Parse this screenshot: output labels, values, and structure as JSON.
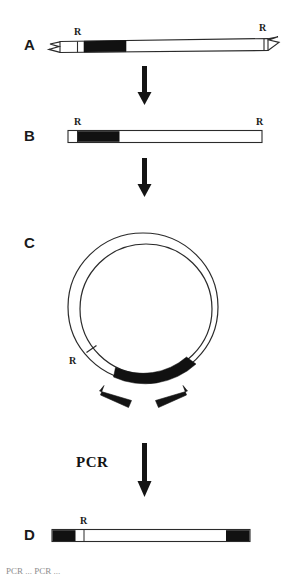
{
  "figure": {
    "type": "diagram",
    "panels": [
      {
        "id": "A",
        "letter": "A",
        "description": "Genomic DNA fragment with broken (zigzag) ends, flanked by two R restriction sites and containing a solid black known-sequence block near the left end",
        "ends": "broken",
        "site_labels": [
          "R",
          "R"
        ],
        "block_fill": "#111111"
      },
      {
        "id": "B",
        "letter": "B",
        "description": "Restriction fragment released by digestion at the two R sites; blunt-ended linear bar with black block at left",
        "ends": "blunt",
        "site_labels": [
          "R",
          "R"
        ],
        "block_fill": "#111111"
      },
      {
        "id": "C",
        "letter": "C",
        "description": "Self-ligated circular molecule; black arc marks the known block, a tick marks the regenerated R site, and two divergent primer arrows point outward",
        "site_labels": [
          "R"
        ],
        "arc_fill": "#111111",
        "primers": 2
      },
      {
        "id": "D",
        "letter": "D",
        "description": "Inverse PCR product: linear bar with black segments at both ends and the R site near the left",
        "ends": "blunt",
        "site_labels": [
          "R"
        ],
        "block_fill": "#111111"
      }
    ],
    "steps": [
      {
        "from": "A",
        "to": "B",
        "label": ""
      },
      {
        "from": "B",
        "to": "C",
        "label": ""
      },
      {
        "from": "C",
        "to": "D",
        "label": "PCR"
      }
    ],
    "labels": {
      "panel_a": "A",
      "panel_b": "B",
      "panel_c": "C",
      "panel_d": "D",
      "r_a_left": "R",
      "r_a_right": "R",
      "r_b_left": "R",
      "r_b_right": "R",
      "r_c": "R",
      "r_d": "R",
      "pcr": "PCR"
    },
    "caption": "PCR ... PCR ...",
    "colors": {
      "ink": "#111111",
      "outline": "#2a2a2a",
      "background": "#ffffff",
      "caption": "#8d8d8d"
    }
  }
}
